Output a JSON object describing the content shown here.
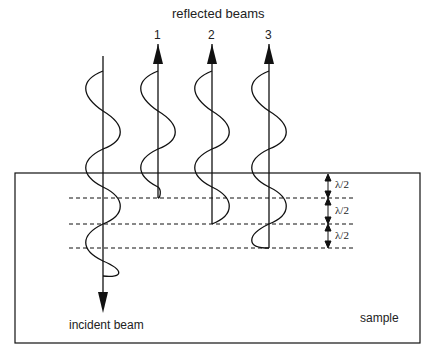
{
  "title": "reflected beams",
  "beam_numbers": [
    "1",
    "2",
    "3"
  ],
  "incident_label": "incident beam",
  "sample_label": "sample",
  "spacing_labels": [
    "λ/2",
    "λ/2",
    "λ/2"
  ],
  "colors": {
    "stroke": "#111111",
    "background": "#ffffff"
  }
}
